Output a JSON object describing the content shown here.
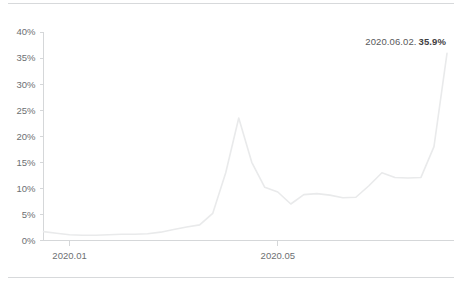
{
  "chart_data": {
    "type": "line",
    "title": "",
    "subtitle": "",
    "xlabel": "",
    "ylabel": "",
    "ylim": [
      0,
      40
    ],
    "grid": false,
    "legend": null,
    "y_ticks": [
      "0%",
      "5%",
      "10%",
      "15%",
      "20%",
      "25%",
      "30%",
      "35%",
      "40%"
    ],
    "y_tick_values": [
      0,
      5,
      10,
      15,
      20,
      25,
      30,
      35,
      40
    ],
    "x_ticks": [
      "2020.01",
      "2020.05"
    ],
    "x_tick_positions": [
      2,
      18
    ],
    "series": [
      {
        "name": "percentage",
        "color": "#e9eaeb",
        "x": [
          0,
          1,
          2,
          3,
          4,
          5,
          6,
          7,
          8,
          9,
          10,
          11,
          12,
          13,
          14,
          15,
          16,
          17,
          18,
          19,
          20,
          21,
          22,
          23,
          24
        ],
        "values": [
          1.7,
          1.4,
          1.1,
          1.0,
          1.0,
          1.1,
          1.2,
          1.2,
          1.3,
          1.6,
          2.1,
          2.6,
          3.0,
          5.2,
          13.0,
          23.5,
          15.0,
          10.2,
          9.3,
          7.0,
          8.8,
          9.0,
          8.7,
          8.2,
          8.3
        ]
      }
    ],
    "annotation": {
      "date": "2020.06.02.",
      "value": "35.9%"
    },
    "peak": {
      "label": "spike",
      "value": 23.5
    },
    "final_value": 35.9
  },
  "series_tail": {
    "x": [
      25,
      26,
      27,
      28,
      29,
      30,
      31
    ],
    "values": [
      10.5,
      13.0,
      12.1,
      12.0,
      12.1,
      18.0,
      35.9
    ]
  },
  "axis": {
    "y_axis_color": "#d5d7d9",
    "x_axis_color": "#d5d7d9",
    "tick_text_color": "#6d6f72"
  },
  "dividers": {
    "color": "#d7d9db"
  }
}
